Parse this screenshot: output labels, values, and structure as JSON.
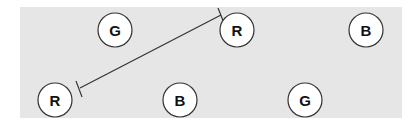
{
  "panel": {
    "x": 20,
    "y": 7,
    "width": 382,
    "height": 111,
    "fill": "#e6e6e6"
  },
  "nodes": [
    {
      "id": "n1",
      "label": "G",
      "cx": 115,
      "cy": 30,
      "r": 17
    },
    {
      "id": "n2",
      "label": "R",
      "cx": 237,
      "cy": 30,
      "r": 17
    },
    {
      "id": "n3",
      "label": "B",
      "cx": 366,
      "cy": 30,
      "r": 17
    },
    {
      "id": "n4",
      "label": "R",
      "cx": 55,
      "cy": 100,
      "r": 17
    },
    {
      "id": "n5",
      "label": "B",
      "cx": 180,
      "cy": 100,
      "r": 17
    },
    {
      "id": "n6",
      "label": "G",
      "cx": 305,
      "cy": 100,
      "r": 17
    }
  ],
  "edges": [
    {
      "from": "n4",
      "to": "n2",
      "x1": 80,
      "y1": 88,
      "x2": 220,
      "y2": 16,
      "style": "inhibition-ends"
    }
  ]
}
